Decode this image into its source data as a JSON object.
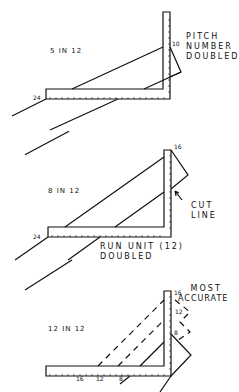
{
  "diagrams": [
    {
      "pitch_label": "5 IN 12",
      "run_mark": "24",
      "rise_mark": "10",
      "annotation": [
        "PITCH",
        "NUMBER",
        "DOUBLED"
      ]
    },
    {
      "pitch_label": "8 IN 12",
      "run_mark": "24",
      "rise_mark": "16",
      "annotation": [
        "CUT",
        "LINE"
      ],
      "bottom_annotation": [
        "RUN UNIT (12)",
        "DOUBLED"
      ]
    },
    {
      "pitch_label": "12 IN 12",
      "rise_marks": [
        "16",
        "12",
        "8"
      ],
      "run_marks": [
        "16",
        "12",
        "8"
      ],
      "annotation": [
        "MOST",
        "ACCURATE"
      ]
    }
  ]
}
